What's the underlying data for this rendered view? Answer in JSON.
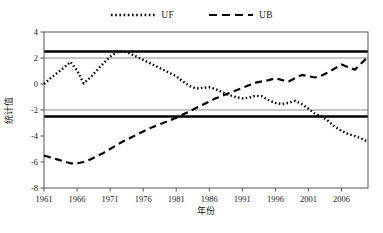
{
  "legend": {
    "position": "top-center",
    "entries": [
      {
        "label": "UF",
        "style": "dotted",
        "icon": "dotted-line-icon",
        "color": "#000000"
      },
      {
        "label": "UB",
        "style": "dashed",
        "icon": "dashed-line-icon",
        "color": "#000000"
      }
    ]
  },
  "axes": {
    "y_title": "统计值",
    "x_title": "年份",
    "y_ticks": [
      "4",
      "2",
      "0",
      "-2",
      "-4",
      "-6",
      "-8"
    ],
    "x_ticks": [
      "1961",
      "1966",
      "1971",
      "1976",
      "1981",
      "1986",
      "1991",
      "1996",
      "2001",
      "2006"
    ]
  },
  "colors": {
    "series": "#000000",
    "critical_line": "#000000",
    "gridline": "#b3b3b3",
    "frame": "#555555",
    "background": "#ffffff"
  },
  "chart_data": {
    "type": "line",
    "title": "",
    "subtitle": "",
    "xlabel": "年份",
    "ylabel": "统计值",
    "xlim": [
      1961,
      2010
    ],
    "ylim": [
      -8,
      4
    ],
    "grid": true,
    "gridlines_y": [
      2,
      -2
    ],
    "critical_lines": [
      2.5,
      -2.5
    ],
    "critical_label": "0.05 significance level",
    "legend_position": "top-center",
    "x": [
      1961,
      1962,
      1963,
      1964,
      1965,
      1966,
      1967,
      1968,
      1969,
      1970,
      1971,
      1972,
      1973,
      1974,
      1975,
      1976,
      1977,
      1978,
      1979,
      1980,
      1981,
      1982,
      1983,
      1984,
      1985,
      1986,
      1987,
      1988,
      1989,
      1990,
      1991,
      1992,
      1993,
      1994,
      1995,
      1996,
      1997,
      1998,
      1999,
      2000,
      2001,
      2002,
      2003,
      2004,
      2005,
      2006,
      2007,
      2008,
      2009,
      2010
    ],
    "series": [
      {
        "name": "UF",
        "style": "dotted",
        "values": [
          0.0,
          0.45,
          0.85,
          1.25,
          1.7,
          1.05,
          0.05,
          0.5,
          1.05,
          1.6,
          2.1,
          2.45,
          2.5,
          2.35,
          2.1,
          1.85,
          1.6,
          1.35,
          1.1,
          0.85,
          0.6,
          0.2,
          -0.15,
          -0.35,
          -0.3,
          -0.25,
          -0.4,
          -0.65,
          -0.85,
          -1.0,
          -1.1,
          -1.05,
          -0.9,
          -0.95,
          -1.25,
          -1.45,
          -1.55,
          -1.45,
          -1.3,
          -1.55,
          -1.9,
          -2.3,
          -2.5,
          -2.85,
          -3.3,
          -3.6,
          -3.85,
          -4.0,
          -4.2,
          -4.45
        ],
        "final_values_note": "descends to about -5.5 at series end"
      },
      {
        "name": "UB",
        "style": "dashed",
        "values": [
          -5.5,
          -5.65,
          -5.8,
          -5.95,
          -6.1,
          -6.1,
          -6.0,
          -5.8,
          -5.55,
          -5.3,
          -5.0,
          -4.7,
          -4.4,
          -4.15,
          -3.9,
          -3.65,
          -3.4,
          -3.2,
          -3.0,
          -2.8,
          -2.6,
          -2.35,
          -2.1,
          -1.85,
          -1.6,
          -1.35,
          -1.1,
          -0.9,
          -0.7,
          -0.5,
          -0.3,
          -0.1,
          0.1,
          0.2,
          0.3,
          0.45,
          0.3,
          0.2,
          0.45,
          0.7,
          0.6,
          0.5,
          0.65,
          0.9,
          1.2,
          1.5,
          1.3,
          1.1,
          1.6,
          2.1
        ],
        "final_values_note": "peaks near 2.2 then drops to about 0.5"
      }
    ],
    "annotations": [
      {
        "text": "UF and UB intersect near 1990",
        "x": 1990,
        "y": -2.4
      }
    ]
  }
}
